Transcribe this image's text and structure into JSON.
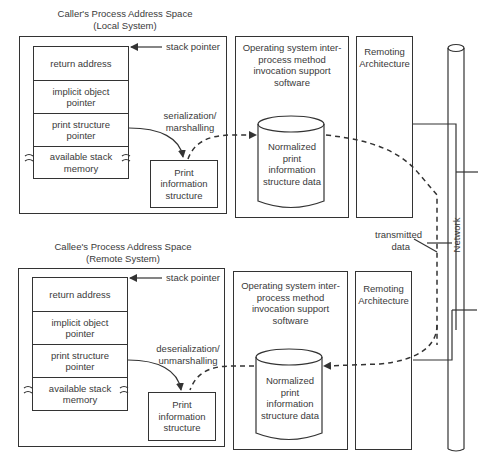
{
  "diagram": {
    "sections": [
      {
        "id": "caller",
        "title_line1": "Caller's Process Address Space",
        "title_line2": "(Local System)",
        "stack_pointer_label": "stack pointer",
        "stack_rows": [
          "return address",
          "implicit object pointer",
          "print structure pointer",
          "available stack memory"
        ],
        "transform_label_line1": "serialization/",
        "transform_label_line2": "marshalling",
        "print_box": "Print information structure",
        "os_box": "Operating system inter-process method invocation support software",
        "cylinder": "Normalized print information structure data",
        "remoting_box": "Remoting Architecture"
      },
      {
        "id": "callee",
        "title_line1": "Callee's Process Address Space",
        "title_line2": "(Remote System)",
        "stack_pointer_label": "stack pointer",
        "stack_rows": [
          "return address",
          "implicit object pointer",
          "print structure pointer",
          "available stack memory"
        ],
        "transform_label_line1": "deserialization/",
        "transform_label_line2": "unmarshalling",
        "print_box": "Print information structure",
        "os_box": "Operating system inter-process method invocation support software",
        "cylinder": "Normalized print information structure data",
        "remoting_box": "Remoting Architecture"
      }
    ],
    "network_label": "Network",
    "transmitted_label_line1": "transmitted",
    "transmitted_label_line2": "data",
    "colors": {
      "line": "#333333",
      "text": "#3a3a3a",
      "background": "#ffffff"
    }
  }
}
